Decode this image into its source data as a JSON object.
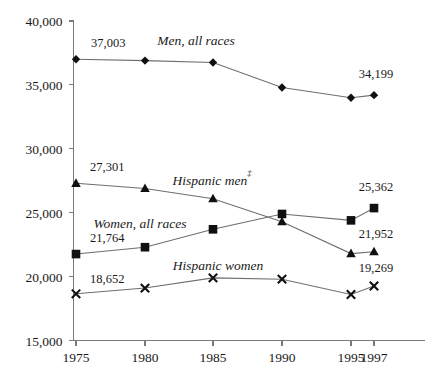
{
  "chart_data": {
    "type": "line",
    "title": "",
    "subtitle": "",
    "xlabel": "",
    "ylabel": "",
    "grid": false,
    "legend_position": "inline-labels",
    "x": [
      1975,
      1980,
      1985,
      1990,
      1995,
      1997
    ],
    "categories": [
      "1975",
      "1980",
      "1985",
      "1990",
      "1995",
      "1997"
    ],
    "xtick_labels": [
      "1975",
      "1980",
      "1985",
      "1990",
      "1995",
      "1997"
    ],
    "ytick_labels": [
      "40,000",
      "35,000",
      "30,000",
      "25,000",
      "20,000",
      "15,000"
    ],
    "ytick_values": [
      40000,
      35000,
      30000,
      25000,
      20000,
      15000
    ],
    "ylim": [
      15000,
      40000
    ],
    "xlim": [
      1975,
      1997
    ],
    "series": [
      {
        "name": "Men, all races",
        "marker": "diamond",
        "values": [
          37003,
          36900,
          36750,
          34800,
          34000,
          34199
        ],
        "start_label": "37,003",
        "end_label": "34,199"
      },
      {
        "name": "Hispanic men",
        "marker": "triangle",
        "footnote_marker": "‡",
        "values": [
          27301,
          26900,
          26100,
          24300,
          21800,
          21952
        ],
        "start_label": "27,301",
        "end_label": "21,952"
      },
      {
        "name": "Women, all races",
        "marker": "square",
        "values": [
          21764,
          22300,
          23700,
          24900,
          24400,
          25362
        ],
        "start_label": "21,764",
        "end_label": "25,362"
      },
      {
        "name": "Hispanic women",
        "marker": "cross",
        "values": [
          18652,
          19100,
          19900,
          19800,
          18600,
          19269
        ],
        "start_label": "18,652",
        "end_label": "19,269"
      }
    ],
    "value_labels": [
      {
        "text": "37,003",
        "series": "Men, all races",
        "position": "start"
      },
      {
        "text": "34,199",
        "series": "Men, all races",
        "position": "end"
      },
      {
        "text": "27,301",
        "series": "Hispanic men",
        "position": "start"
      },
      {
        "text": "21,952",
        "series": "Hispanic men",
        "position": "end"
      },
      {
        "text": "21,764",
        "series": "Women, all races",
        "position": "start"
      },
      {
        "text": "25,362",
        "series": "Women, all races",
        "position": "end"
      },
      {
        "text": "18,652",
        "series": "Hispanic women",
        "position": "start"
      },
      {
        "text": "19,269",
        "series": "Hispanic women",
        "position": "end"
      }
    ],
    "inline_labels": [
      {
        "text": "Men, all races",
        "series": "Men, all races"
      },
      {
        "text": "Hispanic men",
        "series": "Hispanic men",
        "sup": "‡"
      },
      {
        "text": "Women, all races",
        "series": "Women, all races"
      },
      {
        "text": "Hispanic women",
        "series": "Hispanic women"
      }
    ],
    "colors": {
      "axis": "#7a7a7a",
      "line": "#6e6e6e",
      "marker": "#101010",
      "text": "#1a1a1a",
      "background": "#ffffff"
    }
  }
}
